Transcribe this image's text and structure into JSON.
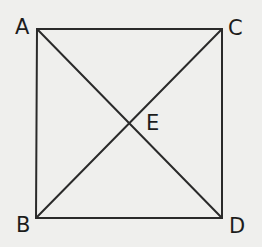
{
  "diagram": {
    "type": "square with diagonals",
    "colors": {
      "background": "#efefed",
      "stroke": "#2a2a2a",
      "text": "#1c1c1c"
    },
    "points": {
      "A": {
        "label": "A",
        "x": 37,
        "y": 29
      },
      "C": {
        "label": "C",
        "x": 222,
        "y": 29
      },
      "B": {
        "label": "B",
        "x": 36,
        "y": 218
      },
      "D": {
        "label": "D",
        "x": 222,
        "y": 218
      },
      "E": {
        "label": "E",
        "x": 129,
        "y": 123
      }
    },
    "segments": [
      "AC",
      "CD",
      "DB",
      "BA",
      "AD",
      "BC"
    ]
  }
}
